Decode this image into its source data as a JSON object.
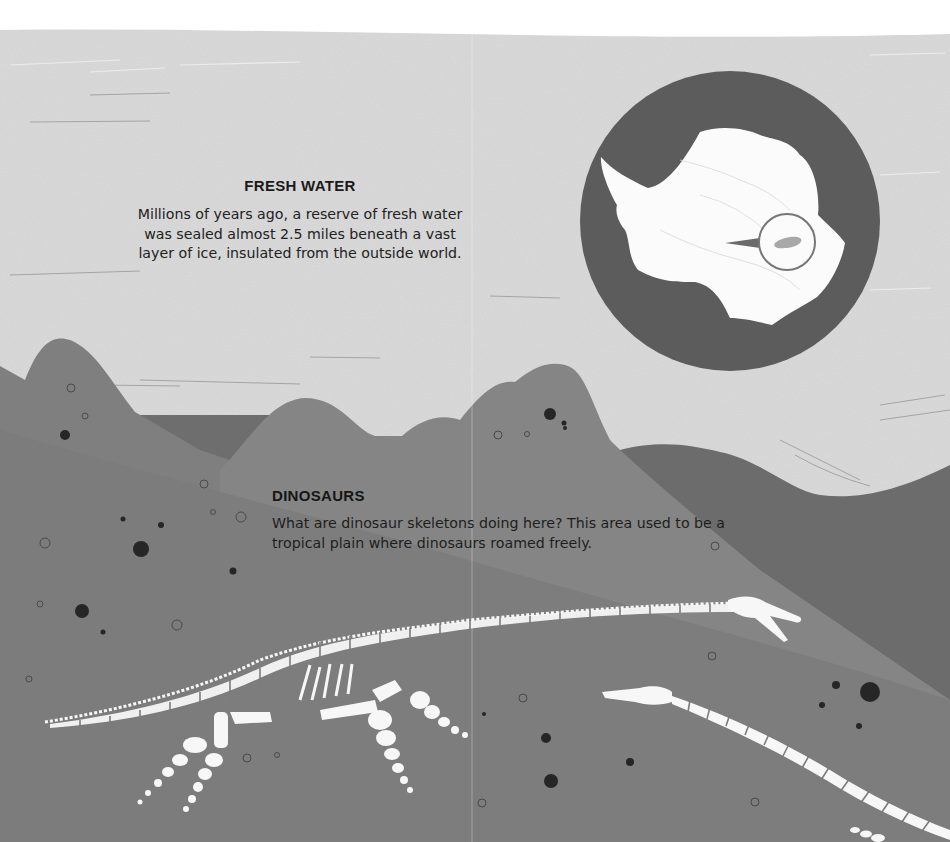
{
  "sections": {
    "fresh_water": {
      "title": "FRESH WATER",
      "body": "Millions of years ago, a reserve of fresh water was sealed almost 2.5 miles beneath a vast layer of ice, insulated from the outside world."
    },
    "dinosaurs": {
      "title": "DINOSAURS",
      "body": "What are dinosaur skeletons doing here? This area used to be a tropical plain where dinosaurs roamed freely."
    }
  },
  "illustration": {
    "map_inset": "antarctica-map-with-magnified-lake",
    "skeletons": [
      "plesiosaur-skeleton-upper",
      "plesiosaur-skeleton-lower"
    ]
  },
  "colors": {
    "sky": "#dcdcdc",
    "far_hills": "#6f6f6f",
    "mid_hills": "#858585",
    "ground": "#7a7a7a",
    "map_circle": "#5c5c5c",
    "continent": "#fbfbfb",
    "bone": "#f7f7f7",
    "pebble": "#262626"
  }
}
